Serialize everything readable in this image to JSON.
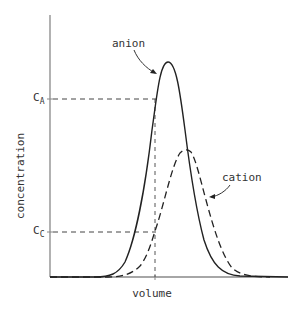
{
  "diagram": {
    "title": "",
    "x_axis": {
      "label": "volume"
    },
    "y_axis": {
      "label": "concentration"
    },
    "reference_levels": [
      {
        "id": "CA",
        "label": "C",
        "subscript": "A",
        "description": "anion concentration at cut volume"
      },
      {
        "id": "CC",
        "label": "C",
        "subscript": "C",
        "description": "cation concentration at cut volume"
      }
    ],
    "curves": [
      {
        "name": "anion",
        "style": "solid",
        "peak_position": "earlier, taller"
      },
      {
        "name": "cation",
        "style": "dashed",
        "peak_position": "later, shorter"
      }
    ],
    "annotations": {
      "anion_label": "anion",
      "cation_label": "cation"
    },
    "colors": {
      "line": "#222222",
      "axis": "#888888",
      "text": "#333333"
    }
  }
}
